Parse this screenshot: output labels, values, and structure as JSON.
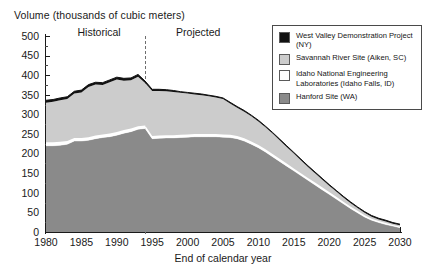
{
  "axis": {
    "y_title": "Volume (thousands of cubic meters)",
    "x_title": "End of calendar year",
    "y_ticks": [
      "500",
      "450",
      "400",
      "350",
      "300",
      "250",
      "200",
      "150",
      "100",
      "50",
      "0"
    ],
    "x_ticks": [
      "1980",
      "1985",
      "1990",
      "1995",
      "2000",
      "2005",
      "2010",
      "2015",
      "2020",
      "2025",
      "2030"
    ]
  },
  "annotations": {
    "historical": "Historical",
    "projected": "Projected"
  },
  "legend": {
    "items": [
      {
        "label": "West Valley Demonstration Project (NY)",
        "color": "#111111"
      },
      {
        "label": "Savannah River Site (Aiken, SC)",
        "color": "#cccccc"
      },
      {
        "label": "Idaho National Engineering Laboratories (Idaho Falls, ID)",
        "color": "#ffffff"
      },
      {
        "label": "Hanford Site (WA)",
        "color": "#8a8a8a"
      }
    ]
  },
  "chart_data": {
    "type": "area",
    "stacked": true,
    "title": "",
    "xlabel": "End of calendar year",
    "ylabel": "Volume (thousands of cubic meters)",
    "xlim": [
      1980,
      2030
    ],
    "ylim": [
      0,
      500
    ],
    "ytick_step": 50,
    "grid": false,
    "legend_position": "top-right",
    "divider_year": 1994,
    "divider_style": "dashed",
    "x": [
      1980,
      1981,
      1982,
      1983,
      1984,
      1985,
      1986,
      1987,
      1988,
      1989,
      1990,
      1991,
      1992,
      1993,
      1994,
      1995,
      1996,
      1997,
      1998,
      1999,
      2000,
      2001,
      2002,
      2003,
      2004,
      2005,
      2006,
      2007,
      2008,
      2009,
      2010,
      2011,
      2012,
      2013,
      2014,
      2015,
      2016,
      2017,
      2018,
      2019,
      2020,
      2021,
      2022,
      2023,
      2024,
      2025,
      2026,
      2027,
      2028,
      2029,
      2030
    ],
    "series": [
      {
        "name": "Hanford Site (WA)",
        "color": "#8a8a8a",
        "values": [
          220,
          220,
          221,
          224,
          232,
          232,
          234,
          238,
          241,
          243,
          247,
          252,
          256,
          262,
          264,
          238,
          239,
          240,
          240,
          241,
          242,
          243,
          243,
          243,
          243,
          242,
          241,
          238,
          232,
          224,
          215,
          204,
          192,
          180,
          168,
          156,
          144,
          132,
          120,
          108,
          96,
          84,
          72,
          60,
          49,
          38,
          30,
          24,
          19,
          15,
          11
        ]
      },
      {
        "name": "Idaho National Engineering Laboratories (Idaho Falls, ID)",
        "color": "#ffffff",
        "values": [
          9,
          9,
          9,
          8,
          8,
          8,
          8,
          8,
          8,
          8,
          8,
          8,
          8,
          8,
          8,
          7,
          7,
          7,
          7,
          7,
          7,
          7,
          7,
          7,
          7,
          7,
          7,
          7,
          7,
          7,
          7,
          7,
          7,
          7,
          7,
          6,
          6,
          6,
          6,
          6,
          6,
          6,
          5,
          5,
          5,
          5,
          4,
          4,
          4,
          3,
          3
        ]
      },
      {
        "name": "Savannah River Site (Aiken, SC)",
        "color": "#cccccc",
        "values": [
          101,
          103,
          106,
          107,
          113,
          116,
          128,
          130,
          126,
          131,
          134,
          126,
          123,
          126,
          108,
          115,
          114,
          112,
          110,
          107,
          104,
          101,
          99,
          96,
          93,
          90,
          80,
          72,
          68,
          64,
          60,
          56,
          52,
          47,
          42,
          38,
          33,
          28,
          24,
          20,
          16,
          13,
          11,
          9,
          7,
          6,
          5,
          4,
          4,
          3,
          3
        ]
      },
      {
        "name": "West Valley Demonstration Project (NY)",
        "color": "#111111",
        "values": [
          6,
          6,
          6,
          6,
          6,
          6,
          6,
          6,
          6,
          6,
          6,
          6,
          6,
          6,
          5,
          4,
          4,
          4,
          4,
          3,
          3,
          3,
          3,
          3,
          3,
          3,
          3,
          3,
          3,
          3,
          3,
          3,
          3,
          3,
          3,
          3,
          3,
          3,
          3,
          3,
          3,
          3,
          3,
          3,
          3,
          3,
          3,
          3,
          3,
          3,
          3
        ]
      }
    ],
    "totals": [
      336,
      338,
      342,
      345,
      359,
      362,
      376,
      382,
      381,
      388,
      395,
      392,
      393,
      402,
      385,
      364,
      364,
      363,
      361,
      358,
      356,
      354,
      352,
      349,
      346,
      342,
      331,
      320,
      310,
      298,
      285,
      270,
      254,
      237,
      220,
      203,
      186,
      169,
      153,
      137,
      121,
      106,
      91,
      77,
      64,
      52,
      42,
      35,
      30,
      24,
      20
    ]
  }
}
